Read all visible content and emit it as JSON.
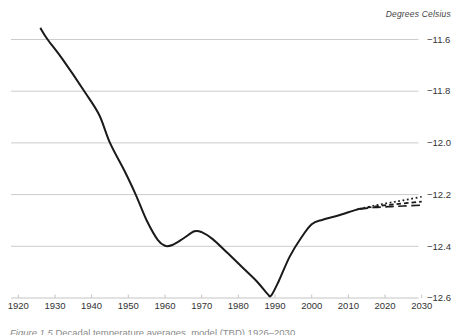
{
  "figure": {
    "right_axis_label": "Degrees Celsius",
    "caption_label": "Figure 1.5",
    "caption_text": "Decadal temperature averages, model (TBD) 1926–2030"
  },
  "colors": {
    "series_line": "#1a1a1a",
    "grid": "#cccccc",
    "axis": "#c4c4c4",
    "tick_label": "#333333",
    "axis_title": "#444444",
    "caption": "#8a8a8a"
  },
  "chart_data": {
    "type": "line",
    "title": "",
    "xlabel": "",
    "ylabel": "Degrees Celsius",
    "ylabel_position": "top-right",
    "grid": "horizontal",
    "legend": "none",
    "xlim": [
      1920,
      2030
    ],
    "ylim": [
      -12.6,
      -11.6
    ],
    "x_tick_values": [
      1920,
      1930,
      1940,
      1950,
      1960,
      1970,
      1980,
      1990,
      2000,
      2010,
      2020,
      2030
    ],
    "x_tick_labels": [
      "1920",
      "1930",
      "1940",
      "1950",
      "1960",
      "1970",
      "1980",
      "1990",
      "2000",
      "2010",
      "2020",
      "2030"
    ],
    "y_tick_values": [
      -11.6,
      -11.8,
      -12.0,
      -12.2,
      -12.4,
      -12.6
    ],
    "y_tick_labels": [
      "−11.6",
      "−11.8",
      "−12.0",
      "−12.2",
      "−12.4",
      "−12.6"
    ],
    "series": [
      {
        "name": "historical-decadal-temperature",
        "style": "solid",
        "width": 2,
        "points": [
          [
            1926,
            -11.555
          ],
          [
            1928,
            -11.6
          ],
          [
            1932,
            -11.675
          ],
          [
            1938,
            -11.8
          ],
          [
            1942,
            -11.89
          ],
          [
            1945,
            -12.0
          ],
          [
            1949,
            -12.11
          ],
          [
            1952,
            -12.2
          ],
          [
            1955,
            -12.3
          ],
          [
            1958,
            -12.375
          ],
          [
            1960,
            -12.398
          ],
          [
            1962,
            -12.395
          ],
          [
            1965,
            -12.37
          ],
          [
            1968,
            -12.342
          ],
          [
            1970,
            -12.345
          ],
          [
            1973,
            -12.372
          ],
          [
            1977,
            -12.425
          ],
          [
            1981,
            -12.48
          ],
          [
            1985,
            -12.535
          ],
          [
            1988,
            -12.585
          ],
          [
            1989,
            -12.59
          ],
          [
            1991,
            -12.535
          ],
          [
            1994,
            -12.44
          ],
          [
            1997,
            -12.37
          ],
          [
            2000,
            -12.315
          ],
          [
            2003,
            -12.297
          ],
          [
            2007,
            -12.282
          ],
          [
            2010,
            -12.268
          ],
          [
            2013,
            -12.255
          ]
        ]
      },
      {
        "name": "projection-high",
        "style": "dotted",
        "width": 1.7,
        "points": [
          [
            2013,
            -12.255
          ],
          [
            2017,
            -12.243
          ],
          [
            2021,
            -12.232
          ],
          [
            2025,
            -12.222
          ],
          [
            2030,
            -12.208
          ]
        ]
      },
      {
        "name": "projection-mid",
        "style": "dashed",
        "width": 1.7,
        "points": [
          [
            2013,
            -12.255
          ],
          [
            2017,
            -12.247
          ],
          [
            2021,
            -12.24
          ],
          [
            2025,
            -12.234
          ],
          [
            2030,
            -12.227
          ]
        ]
      },
      {
        "name": "projection-low",
        "style": "longdash",
        "width": 1.7,
        "points": [
          [
            2013,
            -12.256
          ],
          [
            2017,
            -12.25
          ],
          [
            2021,
            -12.247
          ],
          [
            2025,
            -12.244
          ],
          [
            2030,
            -12.241
          ]
        ]
      }
    ]
  }
}
